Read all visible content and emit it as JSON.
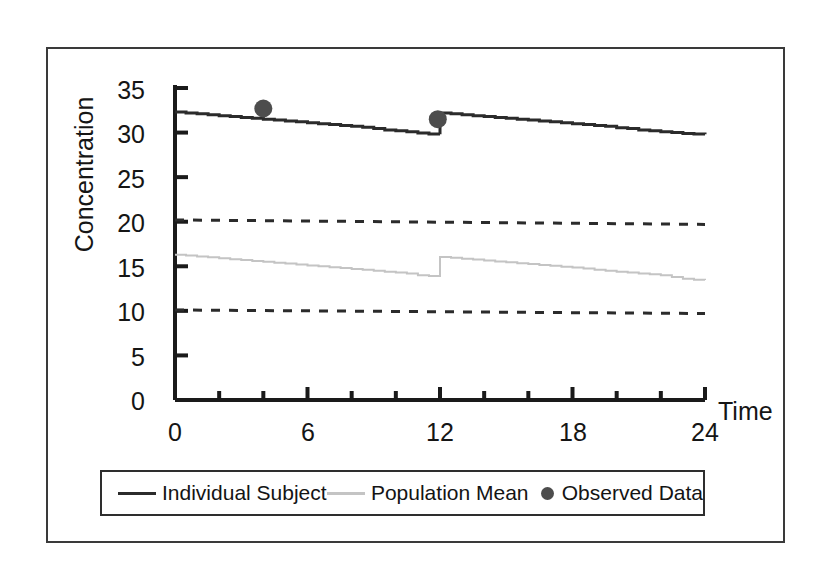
{
  "figure": {
    "frame_color": "#3a3a3a",
    "background": "#ffffff"
  },
  "axis": {
    "y_title": "Concentration",
    "x_title": "Time",
    "y_ticks": [
      "0",
      "5",
      "10",
      "15",
      "20",
      "25",
      "30",
      "35"
    ],
    "x_ticks": [
      "0",
      "6",
      "12",
      "18",
      "24"
    ]
  },
  "legend": {
    "items": [
      {
        "label": "Individual Subject",
        "marker": "line",
        "color": "#2b2b2b"
      },
      {
        "label": "Population Mean",
        "marker": "line",
        "color": "#c4c4c4"
      },
      {
        "label": "Observed Data",
        "marker": "dot",
        "color": "#4d4d4d"
      }
    ]
  },
  "chart_data": {
    "type": "line",
    "title": "",
    "xlabel": "Time",
    "ylabel": "Concentration",
    "xlim": [
      0,
      24
    ],
    "ylim": [
      0,
      35
    ],
    "xticks": [
      0,
      6,
      12,
      18,
      24
    ],
    "xminorticks": [
      0,
      2,
      4,
      6,
      8,
      10,
      12,
      14,
      16,
      18,
      20,
      22,
      24
    ],
    "yticks": [
      0,
      5,
      10,
      15,
      20,
      25,
      30,
      35
    ],
    "grid": false,
    "legend_position": "below-axes",
    "series": [
      {
        "name": "Individual Subject",
        "color": "#2b2b2b",
        "style": "solid",
        "width": 3,
        "x": [
          0,
          0.5,
          1,
          1.5,
          2,
          2.5,
          3,
          3.5,
          4,
          4.5,
          5,
          5.5,
          6,
          6.5,
          7,
          7.5,
          8,
          8.5,
          9,
          9.5,
          10,
          10.5,
          11,
          11.5,
          12,
          12,
          12.5,
          13,
          13.5,
          14,
          14.5,
          15,
          15.5,
          16,
          16.5,
          17,
          17.5,
          18,
          18.5,
          19,
          19.5,
          20,
          20.5,
          21,
          21.5,
          22,
          22.5,
          23,
          23.5,
          24
        ],
        "y": [
          32.3,
          32.2,
          32.1,
          32.0,
          31.9,
          31.8,
          31.7,
          31.6,
          31.5,
          31.4,
          31.3,
          31.2,
          31.1,
          31.0,
          30.9,
          30.8,
          30.7,
          30.6,
          30.45,
          30.3,
          30.2,
          30.1,
          29.95,
          29.85,
          29.8,
          32.2,
          32.1,
          32.0,
          31.9,
          31.8,
          31.7,
          31.6,
          31.5,
          31.4,
          31.3,
          31.2,
          31.1,
          31.0,
          30.9,
          30.8,
          30.7,
          30.55,
          30.45,
          30.3,
          30.2,
          30.1,
          30.0,
          29.9,
          29.85,
          29.8
        ]
      },
      {
        "name": "Population Mean",
        "color": "#c4c4c4",
        "style": "solid",
        "width": 2,
        "x": [
          0,
          0.5,
          1,
          1.5,
          2,
          2.5,
          3,
          3.5,
          4,
          4.5,
          5,
          5.5,
          6,
          6.5,
          7,
          7.5,
          8,
          8.5,
          9,
          9.5,
          10,
          10.5,
          11,
          11.5,
          12,
          12,
          12.5,
          13,
          13.5,
          14,
          14.5,
          15,
          15.5,
          16,
          16.5,
          17,
          17.5,
          18,
          18.5,
          19,
          19.5,
          20,
          20.5,
          21,
          21.5,
          22,
          22.5,
          23,
          23.5,
          24
        ],
        "y": [
          16.3,
          16.2,
          16.1,
          16.0,
          15.9,
          15.8,
          15.7,
          15.6,
          15.5,
          15.4,
          15.3,
          15.2,
          15.1,
          15.0,
          14.9,
          14.8,
          14.7,
          14.6,
          14.5,
          14.4,
          14.3,
          14.2,
          14.0,
          13.9,
          13.8,
          16.05,
          15.95,
          15.85,
          15.75,
          15.65,
          15.55,
          15.45,
          15.35,
          15.25,
          15.15,
          15.05,
          14.95,
          14.85,
          14.75,
          14.6,
          14.5,
          14.4,
          14.3,
          14.2,
          14.1,
          14.0,
          13.8,
          13.6,
          13.5,
          13.45
        ]
      },
      {
        "name": "Upper Reference",
        "color": "#2b2b2b",
        "style": "dashed",
        "width": 3,
        "x": [
          0,
          24
        ],
        "y": [
          20.2,
          19.7
        ]
      },
      {
        "name": "Lower Reference",
        "color": "#2b2b2b",
        "style": "dashed",
        "width": 3,
        "x": [
          0,
          24
        ],
        "y": [
          10.1,
          9.7
        ]
      }
    ],
    "points": [
      {
        "name": "Observed Data",
        "color": "#4d4d4d",
        "x": 4.0,
        "y": 32.7,
        "radius": 9
      },
      {
        "name": "Observed Data",
        "color": "#4d4d4d",
        "x": 11.9,
        "y": 31.5,
        "radius": 9
      }
    ]
  }
}
